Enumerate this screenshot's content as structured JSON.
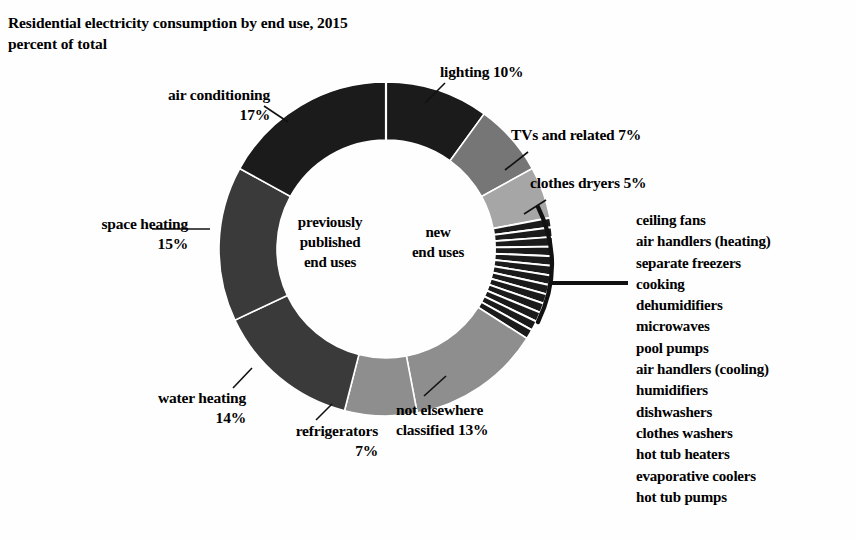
{
  "title": {
    "line1": "Residential electricity consumption by end use, 2015",
    "line2": "percent of total"
  },
  "center": {
    "previously_published": {
      "line1": "previously",
      "line2": "published",
      "line3": "end uses"
    },
    "new": {
      "line1": "new",
      "line2": "end uses"
    }
  },
  "labels": {
    "air_conditioning": {
      "line1": "air conditioning",
      "line2": "17%"
    },
    "space_heating": {
      "line1": "space heating",
      "line2": "15%"
    },
    "water_heating": {
      "line1": "water heating",
      "line2": "14%"
    },
    "refrigerators": {
      "line1": "refrigerators",
      "line2": "7%"
    },
    "not_elsewhere": {
      "line1": "not elsewhere",
      "line2": "classified 13%"
    },
    "lighting": {
      "line1": "lighting 10%"
    },
    "tvs": {
      "line1": "TVs and related 7%"
    },
    "clothes_dryers": {
      "line1": "clothes dryers 5%"
    }
  },
  "detail_list": [
    "ceiling fans",
    "air handlers (heating)",
    "separate freezers",
    "cooking",
    "dehumidifiers",
    "microwaves",
    "pool pumps",
    "air handlers (cooling)",
    "humidifiers",
    "dishwashers",
    "clothes washers",
    "hot tub heaters",
    "evaporative coolers",
    "hot tub pumps"
  ],
  "colors": {
    "dark": "#1b1b1b",
    "mid_dark": "#3a3a3a",
    "mid": "#767676",
    "mid_light": "#8e8e8e",
    "light": "#a6a6a6",
    "background": "#fefefe",
    "stroke": "#ffffff"
  },
  "chart_data": {
    "type": "pie",
    "title": "Residential electricity consumption by end use, 2015",
    "subtitle": "percent of total",
    "units": "percent of total",
    "donut": true,
    "inner_radius_ratio": 0.65,
    "start_angle_deg": 0,
    "direction": "clockwise",
    "legend": "callout-labels",
    "grid": false,
    "categories": [
      "lighting",
      "TVs and related",
      "clothes dryers",
      "new end uses (detail)",
      "not elsewhere classified",
      "refrigerators",
      "water heating",
      "space heating",
      "air conditioning"
    ],
    "values": [
      10,
      7,
      5,
      12,
      13,
      7,
      14,
      15,
      17
    ],
    "labels": [
      "lighting 10%",
      "TVs and related 7%",
      "clothes dryers 5%",
      "",
      "not elsewhere classified 13%",
      "refrigerators 7%",
      "water heating 14%",
      "space heating 15%",
      "air conditioning 17%"
    ],
    "groups": [
      {
        "name": "new end uses",
        "categories": [
          "lighting",
          "TVs and related",
          "clothes dryers",
          "new end uses (detail)",
          "not elsewhere classified"
        ],
        "total": 47
      },
      {
        "name": "previously published end uses",
        "categories": [
          "refrigerators",
          "water heating",
          "space heating",
          "air conditioning"
        ],
        "total": 53
      }
    ],
    "bracketed_detail": {
      "group": "new end uses (detail)",
      "slice_count": 13,
      "items": [
        "ceiling fans",
        "air handlers (heating)",
        "separate freezers",
        "cooking",
        "dehumidifiers",
        "microwaves",
        "pool pumps",
        "air handlers (cooling)",
        "humidifiers",
        "dishwashers",
        "clothes washers",
        "hot tub heaters",
        "evaporative coolers",
        "hot tub pumps"
      ]
    }
  }
}
